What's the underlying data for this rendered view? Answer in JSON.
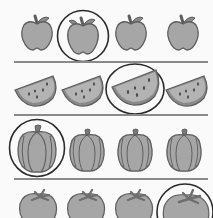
{
  "worksheet": {
    "task": "circle the biggest item in each row",
    "colors": {
      "fill": "#a6a6a6",
      "fill_dark": "#7a7a7a",
      "outline": "#5e5e5e",
      "circle": "#2b2b2b",
      "separator": "#8a8a8a",
      "background": "#fafafa"
    },
    "rows": [
      {
        "name": "apples",
        "item_icon": "apple-icon",
        "items": [
          {
            "index": 1,
            "circled": false
          },
          {
            "index": 2,
            "circled": true
          },
          {
            "index": 3,
            "circled": false
          },
          {
            "index": 4,
            "circled": false
          }
        ]
      },
      {
        "name": "watermelon-slices",
        "item_icon": "watermelon-slice-icon",
        "items": [
          {
            "index": 1,
            "circled": false
          },
          {
            "index": 2,
            "circled": false
          },
          {
            "index": 3,
            "circled": true
          },
          {
            "index": 4,
            "circled": false
          }
        ]
      },
      {
        "name": "pumpkins",
        "item_icon": "pumpkin-icon",
        "items": [
          {
            "index": 1,
            "circled": true
          },
          {
            "index": 2,
            "circled": false
          },
          {
            "index": 3,
            "circled": false
          },
          {
            "index": 4,
            "circled": false
          }
        ]
      },
      {
        "name": "tomatoes",
        "item_icon": "tomato-icon",
        "items": [
          {
            "index": 1,
            "circled": false
          },
          {
            "index": 2,
            "circled": false
          },
          {
            "index": 3,
            "circled": false
          },
          {
            "index": 4,
            "circled": true
          }
        ]
      }
    ]
  }
}
